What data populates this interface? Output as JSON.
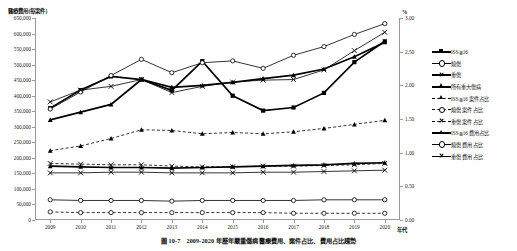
{
  "chart_data": {
    "type": "line",
    "title": "圖 10-7　2009-2020 年歷年嚴重傷病醫療費用、案件占比、費用占比趨勢",
    "xlabel": "年代",
    "ylabel": "醫療費用(每案件)",
    "ylabel_right": "%",
    "x": [
      2009,
      2010,
      2011,
      2012,
      2013,
      2014,
      2015,
      2016,
      2017,
      2018,
      2019,
      2020
    ],
    "ylim": [
      0,
      650000
    ],
    "ylim_right": [
      0.0,
      3.0
    ],
    "yticks": [
      "0",
      "50,000",
      "100,000",
      "150,000",
      "200,000",
      "250,000",
      "300,000",
      "350,000",
      "400,000",
      "450,000",
      "500,000",
      "550,000",
      "600,000",
      "650,000"
    ],
    "yticks_right": [
      "0.00",
      "0.50",
      "1.00",
      "1.50",
      "2.00",
      "2.50",
      "3.00"
    ],
    "grid": false,
    "legend_position": "right",
    "series": [
      {
        "name": "ISS≧16",
        "axis": "left",
        "style": "solid-thick",
        "marker": "square",
        "values": [
          360000,
          418000,
          462000,
          452000,
          417000,
          511000,
          400000,
          352000,
          362000,
          409000,
          508000,
          575000
        ]
      },
      {
        "name": "燒傷",
        "axis": "left",
        "style": "solid",
        "marker": "circle-open",
        "values": [
          357000,
          412000,
          465000,
          517000,
          474000,
          506000,
          512000,
          488000,
          530000,
          558000,
          597000,
          632000
        ]
      },
      {
        "name": "重傷",
        "axis": "left",
        "style": "solid",
        "marker": "x",
        "values": [
          380000,
          418000,
          430000,
          452000,
          410000,
          430000,
          444000,
          450000,
          452000,
          483000,
          545000,
          604000
        ]
      },
      {
        "name": "所有重大傷病",
        "axis": "left",
        "style": "solid-thick",
        "marker": "triangle",
        "values": [
          322000,
          347000,
          372000,
          452000,
          427000,
          433000,
          443000,
          455000,
          466000,
          486000,
          525000,
          572000
        ]
      },
      {
        "name": "ISS≧16 案件占比",
        "axis": "right",
        "style": "dashed",
        "marker": "triangle",
        "values": [
          1.03,
          1.1,
          1.21,
          1.34,
          1.33,
          1.28,
          1.3,
          1.28,
          1.31,
          1.36,
          1.42,
          1.48
        ]
      },
      {
        "name": "燒傷 案件占比",
        "axis": "right",
        "style": "dashed",
        "marker": "circle-open",
        "values": [
          0.12,
          0.11,
          0.11,
          0.11,
          0.11,
          0.11,
          0.11,
          0.11,
          0.1,
          0.1,
          0.1,
          0.1
        ]
      },
      {
        "name": "重傷 案件占比",
        "axis": "right",
        "style": "dashed",
        "marker": "x",
        "values": [
          0.84,
          0.83,
          0.82,
          0.82,
          0.8,
          0.79,
          0.79,
          0.8,
          0.8,
          0.81,
          0.82,
          0.84
        ]
      },
      {
        "name": "ISS≧16 費用占比",
        "axis": "right",
        "style": "solid-thick",
        "marker": "triangle",
        "values": [
          0.8,
          0.79,
          0.78,
          0.78,
          0.77,
          0.78,
          0.79,
          0.8,
          0.81,
          0.82,
          0.84,
          0.85
        ]
      },
      {
        "name": "燒傷 費用占比",
        "axis": "right",
        "style": "solid",
        "marker": "circle-open",
        "values": [
          0.3,
          0.29,
          0.29,
          0.29,
          0.28,
          0.29,
          0.29,
          0.29,
          0.29,
          0.3,
          0.3,
          0.3
        ]
      },
      {
        "name": "重傷 費用占比",
        "axis": "right",
        "style": "solid",
        "marker": "x",
        "values": [
          0.7,
          0.7,
          0.71,
          0.71,
          0.7,
          0.7,
          0.7,
          0.71,
          0.71,
          0.72,
          0.73,
          0.74
        ]
      }
    ]
  },
  "caption": "圖 10-7　2009-2020 年歷年嚴重傷病醫療費用、案件占比、費用占比趨勢"
}
